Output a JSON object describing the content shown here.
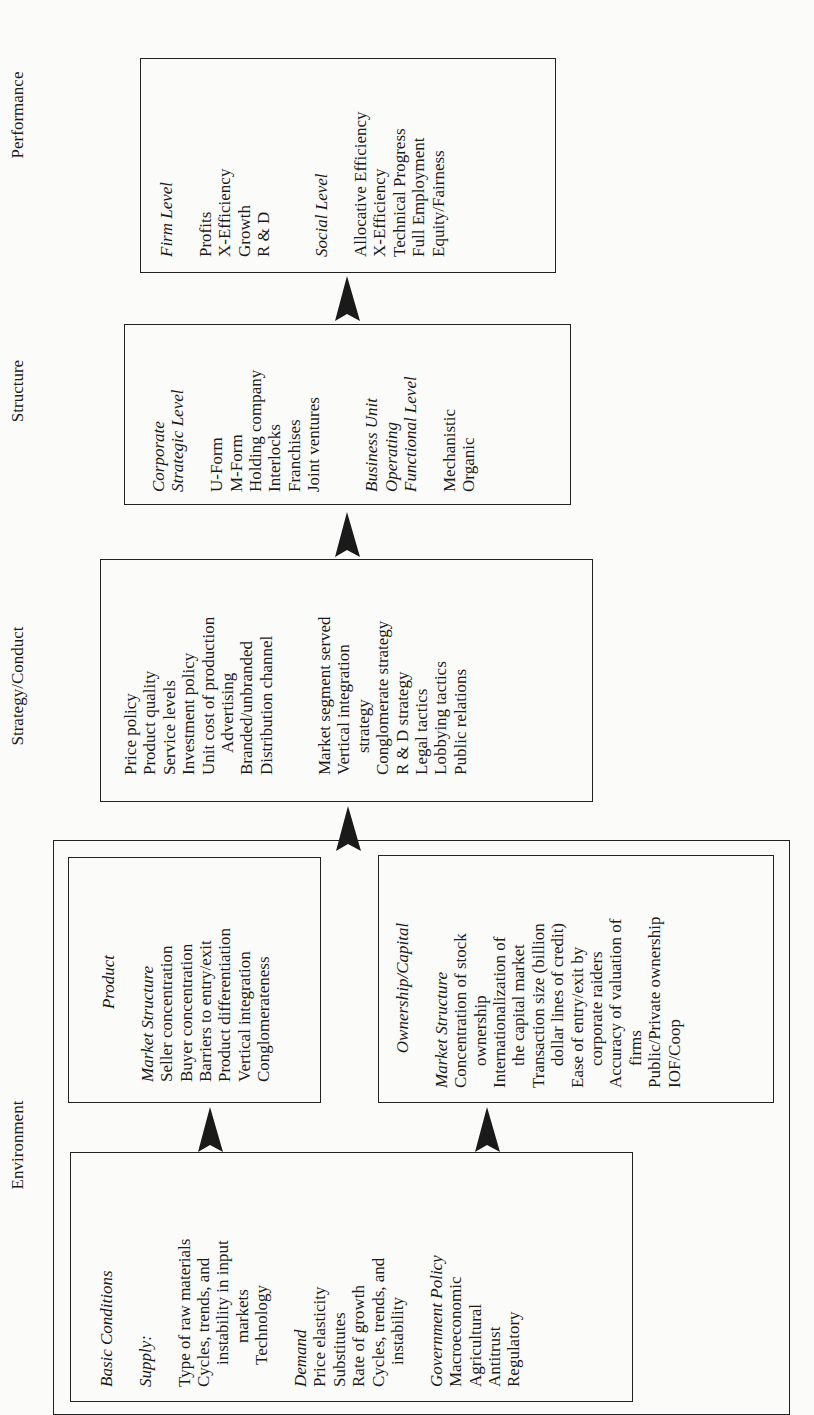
{
  "columns": {
    "environment": "Environment",
    "strategy": "Strategy/Conduct",
    "structure": "Structure",
    "performance": "Performance"
  },
  "basic_conditions": {
    "title": "Basic Conditions",
    "supply_heading": "Supply:",
    "supply_items": [
      "Type of raw materials",
      "Cycles, trends, and",
      "instability in input",
      "markets",
      "Technology"
    ],
    "demand_heading": "Demand",
    "demand_items": [
      "Price elasticity",
      "Substitutes",
      "Rate of growth",
      "Cycles, trends, and",
      "instability"
    ],
    "gov_heading": "Government Policy",
    "gov_items": [
      "Macroeconomic",
      "Agricultural",
      "Antitrust",
      "Regulatory"
    ]
  },
  "product": {
    "title": "Product",
    "subheading": "Market Structure",
    "items": [
      "Seller concentration",
      "Buyer concentration",
      "Barriers to entry/exit",
      "Product differentiation",
      "Vertical integration",
      "Conglomerateness"
    ]
  },
  "ownership": {
    "title": "Ownership/Capital",
    "subheading": "Market Structure",
    "items": [
      "Concentration of stock",
      "ownership",
      "Internationalization of",
      "the capital market",
      "Transaction size (billion",
      "dollar lines of credit)",
      "Ease of entry/exit by",
      "corporate raiders",
      "Accuracy of valuation of",
      "firms",
      "Public/Private ownership",
      "IOF/Coop"
    ]
  },
  "strategy": {
    "group1": [
      "Price policy",
      "Product quality",
      "Service levels",
      "Investment policy",
      "Unit cost of production",
      "Advertising",
      "Branded/unbranded",
      "Distribution channel"
    ],
    "group2": [
      "Market segment served",
      "Vertical integration",
      "strategy",
      "Conglomerate strategy",
      "R & D strategy",
      "Legal tactics",
      "Lobbying tactics",
      "Public relations"
    ]
  },
  "structure": {
    "corp_heading_1": "Corporate",
    "corp_heading_2": "Strategic Level",
    "corp_items": [
      "U-Form",
      "M-Form",
      "Holding company",
      "Interlocks",
      "Franchises",
      "Joint ventures"
    ],
    "bu_heading_1": "Business Unit",
    "bu_heading_2": "Operating",
    "bu_heading_3": "Functional Level",
    "bu_items": [
      "Mechanistic",
      "Organic"
    ]
  },
  "performance": {
    "firm_heading": "Firm Level",
    "firm_items": [
      "Profits",
      "X-Efficiency",
      "Growth",
      "R & D"
    ],
    "social_heading": "Social Level",
    "social_items": [
      "Allocative Efficiency",
      "X-Efficiency",
      "Technical Progress",
      "Full Employment",
      "Equity/Fairness"
    ]
  },
  "colors": {
    "ink": "#1a1a1a",
    "paper": "#fbfbf9"
  }
}
